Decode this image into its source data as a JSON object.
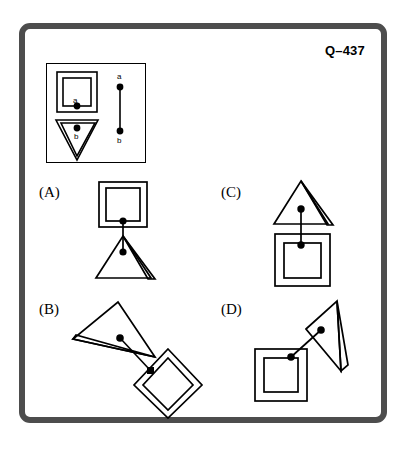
{
  "question": {
    "id_label": "Q–437",
    "type": "figure-matching-analogy"
  },
  "colors": {
    "frame": "#4d4d4d",
    "stroke": "#000000",
    "background": "#ffffff",
    "dot": "#000000"
  },
  "key": {
    "name": "key-panel",
    "nodes": [
      {
        "label": "a",
        "shape": "nested-square",
        "orientation_deg": 0,
        "dot_position": "bottom-center-inner"
      },
      {
        "label": "b",
        "shape": "nested-triangle-down",
        "orientation_deg": 180,
        "dot_position": "top-center-inner"
      }
    ],
    "connector": {
      "from_label": "a",
      "to_label": "b",
      "top_label": "a",
      "bottom_label": "b",
      "style": "vertical-line-with-endpoint-dots"
    }
  },
  "options": [
    {
      "label": "(A)",
      "letter": "A",
      "shapes": [
        {
          "shape": "nested-square",
          "position": "top",
          "rotation_deg": 0,
          "dot": true
        },
        {
          "shape": "nested-triangle-up",
          "position": "bottom",
          "rotation_deg": 0,
          "dot": true
        }
      ],
      "connector": "vertical"
    },
    {
      "label": "(B)",
      "letter": "B",
      "shapes": [
        {
          "shape": "nested-triangle",
          "position": "upper-left",
          "rotation_deg": 118,
          "dot": true
        },
        {
          "shape": "nested-square",
          "position": "lower-right",
          "rotation_deg": 45,
          "dot": true
        }
      ],
      "connector": "diagonal"
    },
    {
      "label": "(C)",
      "letter": "C",
      "shapes": [
        {
          "shape": "nested-triangle-up",
          "position": "top",
          "rotation_deg": 0,
          "dot": true
        },
        {
          "shape": "nested-square",
          "position": "bottom",
          "rotation_deg": 0,
          "dot": true
        }
      ],
      "connector": "vertical"
    },
    {
      "label": "(D)",
      "letter": "D",
      "shapes": [
        {
          "shape": "nested-square",
          "position": "lower-left",
          "rotation_deg": 0,
          "dot": true
        },
        {
          "shape": "nested-triangle",
          "position": "upper-right",
          "rotation_deg": -118,
          "dot": true
        }
      ],
      "connector": "diagonal"
    }
  ]
}
